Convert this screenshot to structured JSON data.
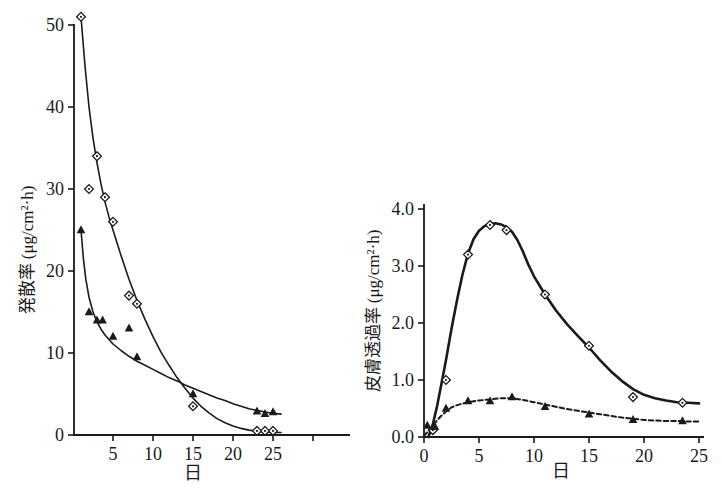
{
  "figure": {
    "background": "#ffffff",
    "ink_color": "#1a1a1a"
  },
  "chart_data": [
    {
      "type": "scatter",
      "name": "evaporation-rate-plot",
      "title": "",
      "xlabel": "日",
      "ylabel": "発散率 (μg/cm²·h)",
      "xlim": [
        0,
        35
      ],
      "ylim": [
        0,
        52
      ],
      "grid": false,
      "xticks": [
        5,
        10,
        15,
        20,
        25,
        30
      ],
      "xtick_labels": [
        "5",
        "10",
        "15",
        "20",
        "25",
        ""
      ],
      "yticks": [
        0,
        10,
        20,
        30,
        40,
        50
      ],
      "ytick_labels": [
        "0",
        "10",
        "20",
        "30",
        "40",
        "50"
      ],
      "series": [
        {
          "name": "evaporation-open-diamond",
          "marker": "open-diamond",
          "line_style": "solid",
          "line_width": 1.6,
          "points": [
            [
              1,
              51
            ],
            [
              2,
              30
            ],
            [
              3,
              34
            ],
            [
              4,
              29
            ],
            [
              5,
              26
            ],
            [
              7,
              17
            ],
            [
              8,
              16
            ],
            [
              15,
              3.5
            ],
            [
              23,
              0.5
            ],
            [
              24,
              0.5
            ],
            [
              25,
              0.5
            ]
          ],
          "curve": [
            [
              1,
              51
            ],
            [
              1.5,
              45
            ],
            [
              2,
              40
            ],
            [
              2.5,
              36.2
            ],
            [
              3,
              33.2
            ],
            [
              3.5,
              30.6
            ],
            [
              4,
              28.4
            ],
            [
              4.5,
              26.6
            ],
            [
              5,
              25
            ],
            [
              6,
              21.9
            ],
            [
              7,
              19
            ],
            [
              8,
              16.4
            ],
            [
              9,
              14.1
            ],
            [
              10,
              12
            ],
            [
              11,
              10.1
            ],
            [
              12,
              8.5
            ],
            [
              13,
              7
            ],
            [
              14,
              5.7
            ],
            [
              15,
              4.5
            ],
            [
              16,
              3.5
            ],
            [
              17,
              2.7
            ],
            [
              18,
              2
            ],
            [
              19,
              1.5
            ],
            [
              20,
              1.1
            ],
            [
              21,
              0.8
            ],
            [
              22,
              0.6
            ],
            [
              23,
              0.45
            ],
            [
              24,
              0.37
            ],
            [
              25,
              0.32
            ],
            [
              26,
              0.3
            ]
          ]
        },
        {
          "name": "evaporation-filled-triangle",
          "marker": "filled-triangle",
          "line_style": "solid",
          "line_width": 1.6,
          "points": [
            [
              1,
              25
            ],
            [
              2,
              15
            ],
            [
              3,
              14
            ],
            [
              3.7,
              14
            ],
            [
              5,
              12
            ],
            [
              7,
              13
            ],
            [
              8,
              9.5
            ],
            [
              15,
              5
            ],
            [
              23,
              2.9
            ],
            [
              24,
              2.6
            ],
            [
              25,
              2.8
            ]
          ],
          "curve": [
            [
              1,
              25
            ],
            [
              1.3,
              21.5
            ],
            [
              1.6,
              19
            ],
            [
              2,
              16.8
            ],
            [
              2.5,
              15
            ],
            [
              3,
              13.8
            ],
            [
              3.5,
              12.9
            ],
            [
              4,
              12.2
            ],
            [
              5,
              11.1
            ],
            [
              6,
              10.3
            ],
            [
              7,
              9.6
            ],
            [
              8,
              9
            ],
            [
              9,
              8.5
            ],
            [
              10,
              8
            ],
            [
              11,
              7.5
            ],
            [
              12,
              7
            ],
            [
              13,
              6.6
            ],
            [
              14,
              6.1
            ],
            [
              15,
              5.7
            ],
            [
              16,
              5.3
            ],
            [
              17,
              4.9
            ],
            [
              18,
              4.5
            ],
            [
              19,
              4.2
            ],
            [
              20,
              3.8
            ],
            [
              21,
              3.5
            ],
            [
              22,
              3.2
            ],
            [
              23,
              3
            ],
            [
              24,
              2.8
            ],
            [
              25,
              2.65
            ],
            [
              26,
              2.55
            ]
          ]
        }
      ]
    },
    {
      "type": "scatter",
      "name": "skin-permeation-plot",
      "title": "",
      "xlabel": "日",
      "ylabel": "皮膚透過率 (μg/cm²·h)",
      "xlim": [
        0,
        26
      ],
      "ylim": [
        0,
        4.2
      ],
      "grid": false,
      "xticks": [
        0,
        5,
        10,
        15,
        20,
        25
      ],
      "xtick_labels": [
        "0",
        "5",
        "10",
        "15",
        "20",
        "25"
      ],
      "yticks": [
        0,
        1,
        2,
        3,
        4
      ],
      "ytick_labels": [
        "0.0",
        "1.0",
        "2.0",
        "3.0",
        "4.0"
      ],
      "series": [
        {
          "name": "permeation-open-diamond",
          "marker": "open-diamond",
          "line_style": "solid",
          "line_width": 2.6,
          "points": [
            [
              0.8,
              0.12
            ],
            [
              2,
              1.0
            ],
            [
              4,
              3.2
            ],
            [
              6,
              3.72
            ],
            [
              7.5,
              3.63
            ],
            [
              11,
              2.5
            ],
            [
              15,
              1.6
            ],
            [
              19,
              0.7
            ],
            [
              23.5,
              0.6
            ]
          ],
          "curve": [
            [
              0.4,
              0
            ],
            [
              0.8,
              0.22
            ],
            [
              1.2,
              0.55
            ],
            [
              1.6,
              0.95
            ],
            [
              2,
              1.35
            ],
            [
              2.5,
              1.9
            ],
            [
              3,
              2.4
            ],
            [
              3.5,
              2.85
            ],
            [
              4,
              3.22
            ],
            [
              4.5,
              3.47
            ],
            [
              5,
              3.62
            ],
            [
              5.5,
              3.7
            ],
            [
              6,
              3.74
            ],
            [
              6.5,
              3.75
            ],
            [
              7,
              3.73
            ],
            [
              7.5,
              3.68
            ],
            [
              8,
              3.6
            ],
            [
              8.5,
              3.45
            ],
            [
              9,
              3.25
            ],
            [
              9.5,
              3.02
            ],
            [
              10,
              2.82
            ],
            [
              11,
              2.5
            ],
            [
              12,
              2.22
            ],
            [
              13,
              1.98
            ],
            [
              14,
              1.77
            ],
            [
              15,
              1.57
            ],
            [
              16,
              1.35
            ],
            [
              17,
              1.15
            ],
            [
              18,
              0.98
            ],
            [
              19,
              0.84
            ],
            [
              20,
              0.74
            ],
            [
              21,
              0.68
            ],
            [
              22,
              0.64
            ],
            [
              23,
              0.61
            ],
            [
              24,
              0.6
            ],
            [
              25,
              0.59
            ]
          ]
        },
        {
          "name": "permeation-filled-triangle",
          "marker": "filled-triangle",
          "line_style": "dashed",
          "line_width": 2.0,
          "points": [
            [
              0.3,
              0.2
            ],
            [
              1,
              0.18
            ],
            [
              2,
              0.5
            ],
            [
              4,
              0.63
            ],
            [
              6,
              0.63
            ],
            [
              8,
              0.7
            ],
            [
              11,
              0.53
            ],
            [
              15,
              0.4
            ],
            [
              19,
              0.3
            ],
            [
              23.5,
              0.28
            ]
          ],
          "curve": [
            [
              0,
              0.02
            ],
            [
              0.5,
              0.13
            ],
            [
              1,
              0.25
            ],
            [
              1.5,
              0.36
            ],
            [
              2,
              0.45
            ],
            [
              2.5,
              0.52
            ],
            [
              3,
              0.56
            ],
            [
              4,
              0.61
            ],
            [
              5,
              0.64
            ],
            [
              6,
              0.66
            ],
            [
              7,
              0.68
            ],
            [
              8,
              0.68
            ],
            [
              9,
              0.65
            ],
            [
              10,
              0.61
            ],
            [
              11,
              0.57
            ],
            [
              12,
              0.53
            ],
            [
              13,
              0.49
            ],
            [
              14,
              0.46
            ],
            [
              15,
              0.43
            ],
            [
              16,
              0.4
            ],
            [
              17,
              0.37
            ],
            [
              18,
              0.34
            ],
            [
              19,
              0.32
            ],
            [
              20,
              0.3
            ],
            [
              21,
              0.29
            ],
            [
              22,
              0.28
            ],
            [
              23,
              0.28
            ],
            [
              24,
              0.27
            ],
            [
              25,
              0.27
            ]
          ]
        }
      ]
    }
  ]
}
